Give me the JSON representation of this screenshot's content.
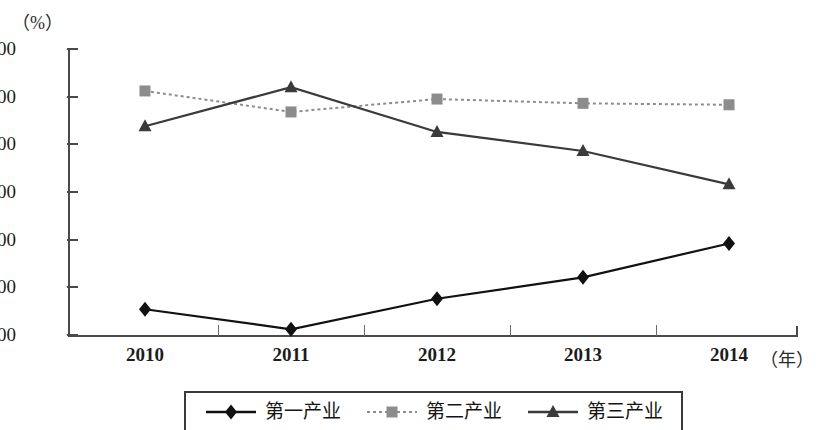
{
  "chart_data": {
    "type": "line",
    "title": "",
    "xlabel": "（年）",
    "ylabel": "（%）",
    "categories": [
      "2010",
      "2011",
      "2012",
      "2013",
      "2014"
    ],
    "ylim": [
      0,
      60
    ],
    "ytick_labels": [
      "60.00",
      "50.00",
      "40.00",
      "30.00",
      "20.00",
      "10.00",
      "0.00"
    ],
    "ytick_values": [
      60,
      50,
      40,
      30,
      20,
      10,
      0
    ],
    "grid": false,
    "legend_position": "bottom",
    "series": [
      {
        "name": "第一产业",
        "marker": "diamond",
        "line_style": "solid",
        "color": "#111111",
        "values": [
          5.4,
          1.2,
          7.6,
          12.1,
          19.2
        ]
      },
      {
        "name": "第二产业",
        "marker": "square",
        "line_style": "dotted",
        "color": "#8c8c8c",
        "values": [
          51.2,
          46.8,
          49.5,
          48.6,
          48.3
        ]
      },
      {
        "name": "第三产业",
        "marker": "triangle",
        "line_style": "solid",
        "color": "#3a3a3a",
        "values": [
          43.8,
          52.0,
          42.6,
          38.6,
          31.6
        ]
      }
    ]
  },
  "axis": {
    "y_unit": "（%）",
    "x_unit": "（年）"
  },
  "colors": {
    "axis": "#4a4a4a",
    "series1": "#111111",
    "series2": "#8c8c8c",
    "series3": "#3a3a3a",
    "text": "#1c1c1c"
  }
}
